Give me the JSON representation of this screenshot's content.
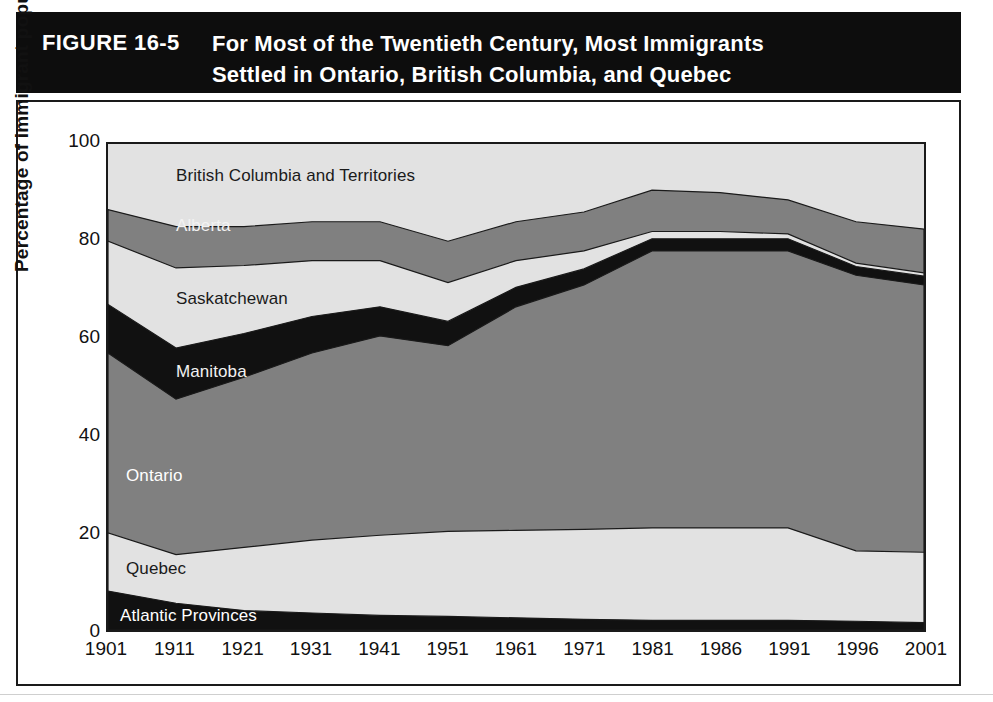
{
  "figure": {
    "number": "FIGURE 16-5",
    "title_lines": [
      "For Most of the Twentieth Century, Most Immigrants",
      "Settled in Ontario, British Columbia, and Quebec"
    ]
  },
  "axes": {
    "y_title": "Percentage of immigrant population",
    "y_ticks": [
      "100",
      "80",
      "60",
      "40",
      "20",
      "0"
    ],
    "x_ticks": [
      "1901",
      "1911",
      "1921",
      "1931",
      "1941",
      "1951",
      "1961",
      "1971",
      "1981",
      "1986",
      "1991",
      "1996",
      "2001"
    ]
  },
  "series_labels": [
    {
      "name": "British Columbia and Territories",
      "color": "#1a1a1a"
    },
    {
      "name": "Alberta",
      "color": "#f2f2f2"
    },
    {
      "name": "Saskatchewan",
      "color": "#1a1a1a"
    },
    {
      "name": "Manitoba",
      "color": "#f2f2f2"
    },
    {
      "name": "Ontario",
      "color": "#ffffff"
    },
    {
      "name": "Quebec",
      "color": "#1a1a1a"
    },
    {
      "name": "Atlantic Provinces",
      "color": "#ffffff"
    }
  ],
  "palette": {
    "light_gray": "#e2e2e2",
    "medium_gray": "#808080",
    "black": "#111111",
    "stroke": "#1a1a1a",
    "banner": "#0d0d0d",
    "page": "#ffffff"
  },
  "chart_data": {
    "type": "area",
    "title": "For Most of the Twentieth Century, Most Immigrants Settled in Ontario, British Columbia, and Quebec",
    "subtitle": "FIGURE 16-5",
    "xlabel": "",
    "ylabel": "Percentage of immigrant population",
    "ylim": [
      0,
      100
    ],
    "xlim": [
      "1901",
      "2001"
    ],
    "stacked": true,
    "normalized_to_100": true,
    "grid": false,
    "legend": "inline-labels",
    "categories": [
      "1901",
      "1911",
      "1921",
      "1931",
      "1941",
      "1951",
      "1961",
      "1971",
      "1981",
      "1986",
      "1991",
      "1996",
      "2001"
    ],
    "series": [
      {
        "name": "Atlantic Provinces",
        "fill": "#111111",
        "values": [
          8.0,
          5.5,
          4.0,
          3.5,
          3.0,
          2.8,
          2.5,
          2.2,
          2.0,
          2.0,
          2.0,
          1.8,
          1.5
        ]
      },
      {
        "name": "Quebec",
        "fill": "#e2e2e2",
        "values": [
          12.0,
          10.0,
          13.0,
          15.0,
          16.5,
          17.5,
          18.0,
          18.5,
          19.0,
          19.0,
          19.0,
          14.5,
          14.5
        ]
      },
      {
        "name": "Ontario",
        "fill": "#808080",
        "values": [
          37.0,
          32.0,
          35.0,
          38.5,
          41.0,
          38.2,
          46.0,
          50.3,
          57.0,
          57.0,
          57.0,
          56.7,
          55.0
        ]
      },
      {
        "name": "Manitoba",
        "fill": "#111111",
        "values": [
          10.0,
          10.5,
          9.0,
          7.5,
          6.0,
          5.0,
          4.0,
          3.3,
          2.5,
          2.5,
          2.5,
          1.8,
          1.8
        ]
      },
      {
        "name": "Saskatchewan",
        "fill": "#e2e2e2",
        "values": [
          13.0,
          16.5,
          14.0,
          11.5,
          9.5,
          8.0,
          5.5,
          3.7,
          1.5,
          1.5,
          1.0,
          0.7,
          0.7
        ]
      },
      {
        "name": "Alberta",
        "fill": "#808080",
        "values": [
          6.5,
          8.5,
          8.0,
          8.0,
          8.0,
          8.5,
          8.0,
          8.0,
          8.5,
          8.0,
          7.0,
          8.5,
          9.0
        ]
      },
      {
        "name": "British Columbia and Territories",
        "fill": "#e2e2e2",
        "values": [
          13.5,
          17.0,
          17.0,
          16.0,
          16.0,
          20.0,
          16.0,
          14.0,
          9.5,
          10.0,
          11.5,
          16.0,
          17.5
        ]
      }
    ],
    "cumulative_tops": {
      "Atlantic Provinces": [
        8.0,
        5.5,
        4.0,
        3.5,
        3.0,
        2.8,
        2.5,
        2.2,
        2.0,
        2.0,
        2.0,
        1.8,
        1.5
      ],
      "Quebec": [
        20.0,
        15.5,
        17.0,
        18.5,
        19.5,
        20.3,
        20.5,
        20.7,
        21.0,
        21.0,
        21.0,
        16.3,
        16.0
      ],
      "Ontario": [
        57.0,
        47.5,
        52.0,
        57.0,
        60.5,
        58.5,
        66.5,
        71.0,
        78.0,
        78.0,
        78.0,
        73.0,
        71.0
      ],
      "Manitoba": [
        67.0,
        58.0,
        61.0,
        64.5,
        66.5,
        63.5,
        70.5,
        74.3,
        80.5,
        80.5,
        80.5,
        74.8,
        72.8
      ],
      "Saskatchewan": [
        80.0,
        74.5,
        75.0,
        76.0,
        76.0,
        71.5,
        76.0,
        78.0,
        82.0,
        82.0,
        81.5,
        75.5,
        73.5
      ],
      "Alberta": [
        86.5,
        83.0,
        83.0,
        84.0,
        84.0,
        80.0,
        84.0,
        86.0,
        90.5,
        90.0,
        88.5,
        84.0,
        82.5
      ],
      "British Columbia and Territories": [
        100,
        100,
        100,
        100,
        100,
        100,
        100,
        100,
        100,
        100,
        100,
        100,
        100
      ]
    }
  }
}
